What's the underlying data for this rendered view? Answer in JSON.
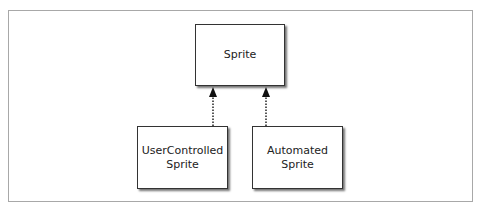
{
  "diagram": {
    "type": "class-inheritance",
    "nodes": [
      {
        "id": "sprite",
        "label": "Sprite",
        "lines": [
          "Sprite"
        ]
      },
      {
        "id": "usercontrolled",
        "label": "UserControlled Sprite",
        "lines": [
          "UserControlled",
          "Sprite"
        ]
      },
      {
        "id": "automated",
        "label": "Automated Sprite",
        "lines": [
          "Automated",
          "Sprite"
        ]
      }
    ],
    "edges": [
      {
        "from": "usercontrolled",
        "to": "sprite",
        "style": "dotted",
        "arrow": "filled"
      },
      {
        "from": "automated",
        "to": "sprite",
        "style": "dotted",
        "arrow": "filled"
      }
    ]
  }
}
